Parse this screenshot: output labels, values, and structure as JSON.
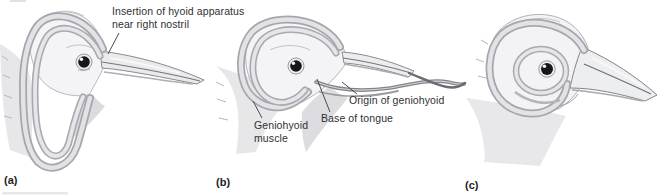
{
  "figure": {
    "annotations": {
      "insertion_line1": "Insertion of hyoid apparatus",
      "insertion_line2": "near right nostril",
      "geniohyoid_line1": "Geniohyoid",
      "geniohyoid_line2": "muscle",
      "base_of_tongue": "Base of tongue",
      "origin_of_geniohyoid": "Origin of geniohyoid"
    },
    "panel_labels": [
      {
        "id": "a",
        "text": "(a)"
      },
      {
        "id": "b",
        "text": "(b)"
      },
      {
        "id": "c",
        "text": "(c)"
      }
    ],
    "colors": {
      "background": "#ffffff",
      "text": "#2f2f33",
      "outline": "#8a8a90",
      "band_edge": "#a6a6ad",
      "band_core": "#e3e3e7",
      "head_fill": "#f4f4f6",
      "shade_fill": "#e7e7ea",
      "eye": "#17171a"
    }
  }
}
